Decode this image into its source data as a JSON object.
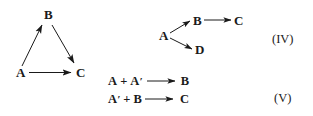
{
  "figure": {
    "background_color": "#ffffff",
    "ink_color": "#1a1a1a"
  },
  "schemes": [
    {
      "id": "triangle-scheme",
      "label": "",
      "nodes": [
        {
          "name": "node-a",
          "text": "A"
        },
        {
          "name": "node-b",
          "text": "B"
        },
        {
          "name": "node-c",
          "text": "C"
        }
      ],
      "edges": [
        {
          "from": "A",
          "to": "B"
        },
        {
          "from": "B",
          "to": "C"
        },
        {
          "from": "A",
          "to": "C"
        }
      ]
    },
    {
      "id": "scheme-iv",
      "label": "(IV)",
      "nodes": [
        {
          "name": "node-a",
          "text": "A"
        },
        {
          "name": "node-b",
          "text": "B"
        },
        {
          "name": "node-c",
          "text": "C"
        },
        {
          "name": "node-d",
          "text": "D"
        }
      ],
      "edges": [
        {
          "from": "A",
          "to": "B"
        },
        {
          "from": "A",
          "to": "D"
        },
        {
          "from": "B",
          "to": "C"
        }
      ]
    },
    {
      "id": "scheme-v",
      "label": "(V)",
      "equations": [
        {
          "left_first": "A",
          "plus": "+",
          "left_second": "A",
          "left_second_prime": "′",
          "right": "B"
        },
        {
          "left_first": "A",
          "left_first_prime": "′",
          "plus": "+",
          "left_second": "B",
          "right": "C"
        }
      ]
    }
  ],
  "triangle": {
    "a": "A",
    "b": "B",
    "c": "C"
  },
  "iv": {
    "a": "A",
    "b": "B",
    "c": "C",
    "d": "D",
    "label": "(IV)"
  },
  "v": {
    "label": "(V)",
    "eq1": {
      "a": "A",
      "plus": "+",
      "aprime_base": "A",
      "aprime_mark": "′",
      "product": "B"
    },
    "eq2": {
      "aprime_base": "A",
      "aprime_mark": "′",
      "plus": "+",
      "b": "B",
      "product": "C"
    }
  }
}
